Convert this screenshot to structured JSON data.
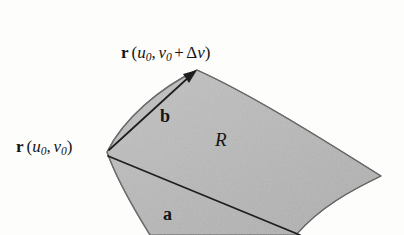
{
  "figure": {
    "background_color": "#fdfdfc",
    "patch": {
      "region_label": "R",
      "fill_color": "#b9b9b9",
      "edge_color": "#4a4a4a"
    },
    "labels": {
      "corner_point": {
        "vector": "r",
        "open_paren": "(",
        "u_symbol": "u",
        "u_subscript": "0",
        "comma": ",",
        "v_symbol": "v",
        "v_subscript": "0",
        "close_paren": ")"
      },
      "top_point": {
        "vector": "r",
        "open_paren": "(",
        "u_symbol": "u",
        "u_subscript": "0",
        "comma": ",",
        "v_symbol": "v",
        "v_subscript": "0",
        "plus": "+",
        "delta": "Δ",
        "delta_var": "v",
        "close_paren": ")"
      },
      "vector_a": "a",
      "vector_b": "b",
      "region": "R"
    }
  }
}
